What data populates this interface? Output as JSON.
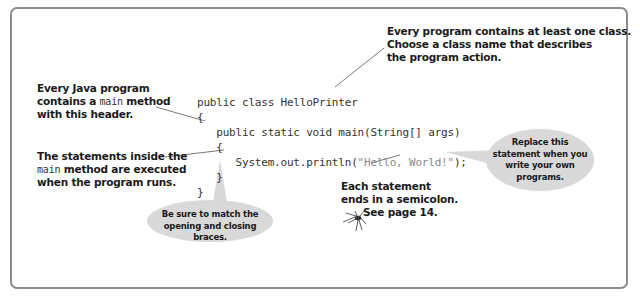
{
  "diagram": {
    "code": {
      "lines": [
        "public class HelloPrinter",
        "{",
        "   public static void main(String[] args)",
        "   {",
        "      System.out.println(",
        "   }",
        "}"
      ],
      "string_literal": "\"Hello, World!\"",
      "line5_tail": ");"
    },
    "annotations": {
      "class_note": {
        "line1": "Every program contains at least one class.",
        "line2": "Choose a class name that describes",
        "line3": "the program action."
      },
      "main_note": {
        "line1": "Every Java program",
        "line2_pre": "contains a ",
        "line2_code": "main",
        "line2_post": " method",
        "line3": "with this header."
      },
      "statements_note": {
        "line1": "The statements inside the",
        "line2_code": "main",
        "line2_post": " method are executed",
        "line3": "when the program runs."
      },
      "semicolon_note": {
        "line1": "Each statement",
        "line2": "ends in a semicolon.",
        "line3": "See page 14.",
        "icon": "spider-icon"
      }
    },
    "bubbles": {
      "braces": {
        "line1": "Be sure to match the",
        "line2": "opening and closing braces."
      },
      "replace": {
        "line1": "Replace this",
        "line2": "statement when you",
        "line3": "write your own",
        "line4": "programs."
      }
    },
    "colors": {
      "frame_border": "#8c8c8c",
      "bubble_fill": "#d9d9d9",
      "text": "#1a1a1a",
      "code": "#333333",
      "string_literal": "#8a8a8a",
      "leader_line": "#555555"
    }
  }
}
